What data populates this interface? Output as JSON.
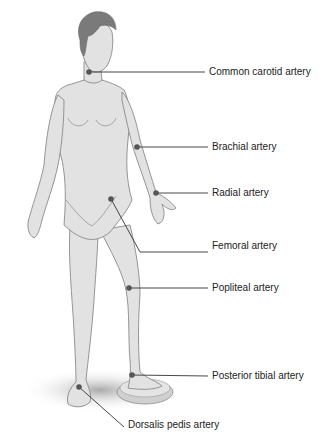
{
  "colors": {
    "skin": "#e2e2e2",
    "outline": "#8a8a8a",
    "hair": "#7a7a7a",
    "point": "#555555",
    "leader": "#333333",
    "text": "#222222",
    "shadow": "#bdbdbd"
  },
  "labels": [
    {
      "id": "carotid",
      "text": "Common carotid artery",
      "x": 209,
      "y": 66,
      "px": 89,
      "py": 72
    },
    {
      "id": "brachial",
      "text": "Brachial artery",
      "x": 212,
      "y": 141,
      "px": 137,
      "py": 147
    },
    {
      "id": "radial",
      "text": "Radial artery",
      "x": 212,
      "y": 187,
      "px": 156,
      "py": 193
    },
    {
      "id": "femoral",
      "text": "Femoral artery",
      "x": 212,
      "y": 246,
      "px": 111,
      "py": 199
    },
    {
      "id": "popliteal",
      "text": "Popliteal artery",
      "x": 212,
      "y": 282,
      "px": 129,
      "py": 288
    },
    {
      "id": "posterior_tibial",
      "text": "Posterior tibial artery",
      "x": 212,
      "y": 370,
      "px": 132,
      "py": 375
    },
    {
      "id": "dorsalis_pedis",
      "text": "Dorsalis pedis artery",
      "x": 128,
      "y": 419,
      "px": 79,
      "py": 387
    }
  ]
}
